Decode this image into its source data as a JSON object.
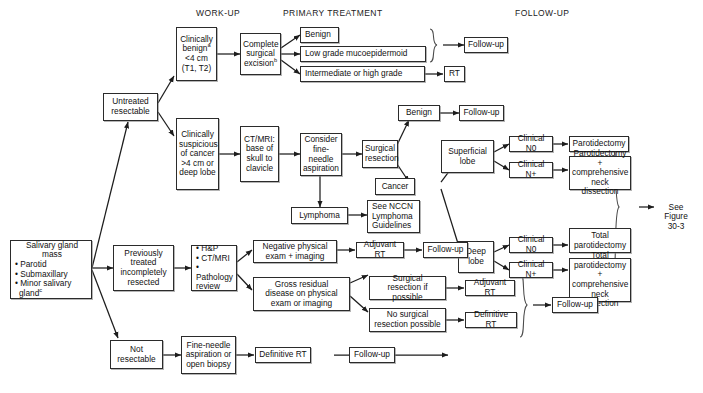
{
  "figure": {
    "columns": [
      {
        "id": "work-up",
        "label": "WORK-UP"
      },
      {
        "id": "primary-treatment",
        "label": "PRIMARY TREATMENT"
      },
      {
        "id": "follow-up",
        "label": "FOLLOW-UP"
      }
    ]
  },
  "nodes": {
    "salivary_gland_mass": "Salivary gland\nmass\n• Parotid\n• Submaxillary\n• Minor salivary\n  gland",
    "salivary_gland_mass_lines": [
      "Salivary gland",
      "mass",
      "• Parotid",
      "• Submaxillary",
      "• Minor salivary",
      "gland"
    ],
    "untreated_resectable": "Untreated\nresectable",
    "previously_treated": "Previously\ntreated\nincompletely\nresected",
    "not_resectable": "Not\nresectable",
    "clinically_benign": "Clinically\nbenign\n<4 cm\n(T1, T2)",
    "clinically_suspicious": "Clinically\nsuspicious\nof cancer\n>4 cm or\ndeep lobe",
    "hp_ctmri_path": "• H&P\n• CT/MRI\n• Pathology\n  review",
    "fna_or_open_biopsy": "Fine-needle\naspiration or\nopen biopsy",
    "complete_surgical_excision": "Complete\nsurgical\nexcision",
    "ct_mri_base_skull": "CT/MRI:\nbase of\nskull to\nclavicle",
    "consider_fna": "Consider\nfine-needle\naspiration",
    "lymphoma": "Lymphoma",
    "see_nccn_lymphoma": "See NCCN\nLymphoma\nGuidelines",
    "surgical_resection": "Surgical\nresection",
    "benign_top": "Benign",
    "low_grade_mucoepidermoid": "Low grade mucoepidermoid",
    "intermediate_or_high_grade": "Intermediate or high grade",
    "rt": "RT",
    "benign_mid": "Benign",
    "cancer": "Cancer",
    "superficial_lobe": "Superficial\nlobe",
    "deep_lobe": "Deep\nlobe",
    "clinical_n0_sup": "Clinical N0",
    "clinical_np_sup": "Clinical N+",
    "clinical_n0_deep": "Clinical N0",
    "clinical_np_deep": "Clinical N+",
    "parotidectomy": "Parotidectomy",
    "parotidectomy_neck": "Parotidectomy +\ncomprehensive\nneck dissection",
    "total_parotidectomy": "Total\nparotidectomy",
    "total_parotidectomy_neck": "Total\nparotidectomy +\ncomprehensive\nneck dissection",
    "negative_physical_exam": "Negative physical\nexam + imaging",
    "gross_residual_disease": "Gross residual\ndisease on physical\nexam or imaging",
    "adjuvant_rt_top": "Adjuvant RT",
    "adjuvant_rt_mid": "Adjuvant RT",
    "surgical_resection_if_possible": "Surgical\nresection if possible",
    "no_surgical_resection": "No surgical\nresection possible",
    "definitive_rt_mid": "Definitive RT",
    "definitive_rt_bottom": "Definitive RT",
    "follow_up_1": "Follow-up",
    "follow_up_2": "Follow-up",
    "follow_up_3": "Follow-up",
    "follow_up_4": "Follow-up",
    "follow_up_5": "Follow-up",
    "follow_up_6": "Follow-up",
    "see_figure": "See\nFigure\n30-3"
  },
  "superscripts": {
    "benign_note": "a",
    "excision_note": "b",
    "gland_note": "c"
  }
}
